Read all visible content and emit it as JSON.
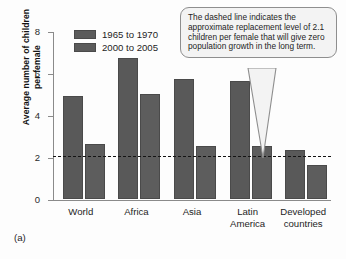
{
  "panel_label": "(a)",
  "callout": {
    "text": "The dashed line indicates the approximate replacement level of 2.1 children per female that will give zero population growth in the long term.",
    "pointer_icon": "callout-pointer-icon"
  },
  "colors": {
    "bar_series_1": "#595959",
    "bar_series_2": "#5d5d5d",
    "axis": "#8a8a8a",
    "dashed_line": "#141414",
    "callout_background": "#f3f3f3",
    "callout_border": "#8e8e8e"
  },
  "chart_data": {
    "type": "bar",
    "title": "",
    "xlabel": "",
    "ylabel": "Average number of children\nper female",
    "ylim": [
      0,
      8
    ],
    "yticks": [
      0,
      2,
      4,
      6,
      8
    ],
    "ytick_labels": [
      "0",
      "2",
      "4",
      "6",
      "8"
    ],
    "grid": false,
    "legend_position": "top-left-inside",
    "categories": [
      "World",
      "Africa",
      "Asia",
      "Latin\nAmerica",
      "Developed\ncountries"
    ],
    "series": [
      {
        "name": "1965 to 1970",
        "values": [
          4.9,
          6.7,
          5.7,
          5.6,
          2.3
        ]
      },
      {
        "name": "2000 to 2005",
        "values": [
          2.6,
          5.0,
          2.5,
          2.5,
          1.6
        ]
      }
    ],
    "annotations": [
      {
        "type": "hline",
        "label": "replacement level",
        "value": 2.1,
        "style": "dashed"
      }
    ]
  }
}
